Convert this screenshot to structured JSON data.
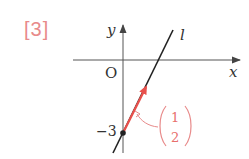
{
  "problem": {
    "number_label": "[3]"
  },
  "axes": {
    "x_label": "x",
    "y_label": "y",
    "origin_label": "O"
  },
  "line": {
    "name": "l"
  },
  "point": {
    "y_intercept_label": "−3",
    "y_intercept_value": -3
  },
  "direction_vector": {
    "top": "1",
    "bottom": "2",
    "components": [
      1,
      2
    ]
  },
  "colors": {
    "accent": "#e8706c",
    "label_pink": "#e88a8a",
    "ink": "#222222",
    "axis": "#555555"
  }
}
